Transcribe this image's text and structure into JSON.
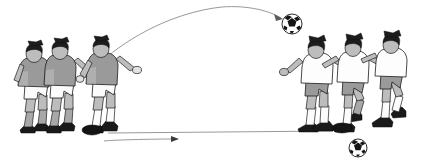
{
  "scene": {
    "title": "Soccer passing technique illustration",
    "background_color": "#ffffff",
    "width": 433,
    "height": 161,
    "caption": ""
  },
  "palette": {
    "dark_jersey": "#9a9a9a",
    "light_jersey": "#fdfdfd",
    "outline": "#1b1b1b",
    "hair": "#1d1d1d",
    "boot": "#1a1a1a",
    "trajectory_line": "#8c8c8c",
    "ground_line": "#7d7d7d",
    "ball_white": "#ffffff",
    "ball_black": "#151515"
  },
  "groups": {
    "left": {
      "label": "Left player group",
      "count": 3,
      "kit": "gray jersey, white shorts, dark boots",
      "players": [
        {
          "label": "Rear left player",
          "pose": "standing, arm forward"
        },
        {
          "label": "Middle left player",
          "pose": "striding forward"
        },
        {
          "label": "Kicking player",
          "pose": "follow-through after lofted kick"
        }
      ]
    },
    "right": {
      "label": "Right player group",
      "count": 3,
      "kit": "white jersey, gray shorts, dark boots",
      "players": [
        {
          "label": "Leading right player",
          "pose": "leaning forward, arms out"
        },
        {
          "label": "Middle right player",
          "pose": "knee raised"
        },
        {
          "label": "Trailing right player",
          "pose": "running, arm extended"
        }
      ]
    }
  },
  "balls": [
    {
      "label": "Lofted soccer ball",
      "type": "soccer-ball",
      "x": 292,
      "y": 24,
      "r": 10
    },
    {
      "label": "Grounded soccer ball",
      "type": "soccer-ball",
      "x": 358,
      "y": 148,
      "r": 9
    },
    {
      "label": "Ball at left players feet",
      "type": "oval-ball",
      "x": 92,
      "y": 130
    },
    {
      "label": "Ball at right players feet",
      "type": "oval-ball",
      "x": 342,
      "y": 128
    }
  ],
  "paths": [
    {
      "label": "Lofted pass trajectory",
      "kind": "curved-arc",
      "arrow_head": true,
      "start": {
        "x": 101,
        "y": 62
      },
      "apex": {
        "x": 222,
        "y": 7
      },
      "end": {
        "x": 283,
        "y": 19
      }
    },
    {
      "label": "Ground pass trajectory",
      "kind": "straight",
      "arrow_head": true,
      "start": {
        "x": 104,
        "y": 141
      },
      "end": {
        "x": 179,
        "y": 139
      }
    },
    {
      "label": "Ground surface line",
      "kind": "ground",
      "arrow_head": false,
      "start": {
        "x": 108,
        "y": 133
      },
      "end": {
        "x": 333,
        "y": 131
      }
    }
  ]
}
